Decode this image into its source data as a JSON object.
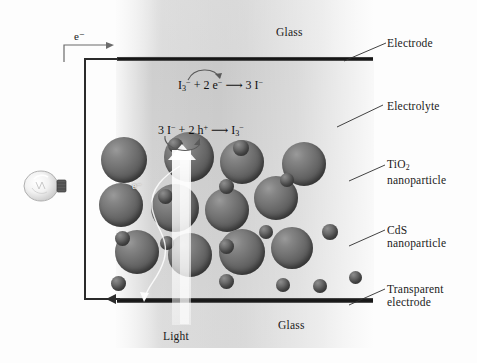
{
  "figure": {
    "glass_top_label": "Glass",
    "glass_bottom_label": "Glass",
    "light_label": "Light",
    "electron_label": "e⁻",
    "electron_inner_label": "e⁻"
  },
  "equations": {
    "top": {
      "reactant_species": "I",
      "reactant_sub": "3",
      "reactant_charge": "−",
      "plus": "+",
      "electrons": "2 e",
      "electrons_charge": "−",
      "arrow": "⟶",
      "product": "3 I",
      "product_charge": "−",
      "full_text": "I3⁻ + 2 e⁻ ⟶ 3 I⁻"
    },
    "bottom": {
      "reactant_species": "3 I",
      "reactant_charge": "−",
      "plus": "+",
      "holes": "2 h",
      "holes_charge": "+",
      "arrow": "⟶",
      "product": "I",
      "product_sub": "3",
      "product_charge": "−",
      "full_text": "3 I⁻ + 2 h⁺ ⟶ I3⁻"
    }
  },
  "callouts": [
    {
      "id": "electrode",
      "line1": "Electrode",
      "line2": ""
    },
    {
      "id": "electrolyte",
      "line1": "Electrolyte",
      "line2": ""
    },
    {
      "id": "tio2",
      "line1": "TiO",
      "sub": "2",
      "line2": "nanoparticle"
    },
    {
      "id": "cds",
      "line1": "CdS",
      "line2": "nanoparticle"
    },
    {
      "id": "transparent-elec",
      "line1": "Transparent",
      "line2": "electrode"
    }
  ],
  "colors": {
    "particle_fill": "#6a6a6a",
    "electrode": "#1b1b1b",
    "electrolyte": "#cccccc",
    "glass": "#e2e2e2",
    "wire": "#2b2b2b",
    "light_beam": "#ffffff",
    "text": "#1a1a1a"
  },
  "particles": {
    "tio2_note": "large gray spheres",
    "cds_note": "small gray spheres",
    "large": [
      {
        "x": 124,
        "y": 160,
        "d": 46
      },
      {
        "x": 189,
        "y": 157,
        "d": 50
      },
      {
        "x": 242,
        "y": 162,
        "d": 44
      },
      {
        "x": 304,
        "y": 164,
        "d": 44
      },
      {
        "x": 121,
        "y": 205,
        "d": 44
      },
      {
        "x": 175,
        "y": 208,
        "d": 48
      },
      {
        "x": 227,
        "y": 210,
        "d": 44
      },
      {
        "x": 276,
        "y": 198,
        "d": 44
      },
      {
        "x": 137,
        "y": 252,
        "d": 44
      },
      {
        "x": 190,
        "y": 255,
        "d": 44
      },
      {
        "x": 242,
        "y": 252,
        "d": 46
      },
      {
        "x": 292,
        "y": 248,
        "d": 42
      }
    ],
    "small": [
      {
        "x": 241,
        "y": 148,
        "d": 16
      },
      {
        "x": 175,
        "y": 145,
        "d": 15
      },
      {
        "x": 226,
        "y": 186,
        "d": 15
      },
      {
        "x": 287,
        "y": 180,
        "d": 14
      },
      {
        "x": 165,
        "y": 196,
        "d": 15
      },
      {
        "x": 266,
        "y": 232,
        "d": 14
      },
      {
        "x": 330,
        "y": 232,
        "d": 16
      },
      {
        "x": 122,
        "y": 238,
        "d": 15
      },
      {
        "x": 167,
        "y": 243,
        "d": 14
      },
      {
        "x": 226,
        "y": 246,
        "d": 15
      },
      {
        "x": 118,
        "y": 283,
        "d": 15
      },
      {
        "x": 226,
        "y": 281,
        "d": 15
      },
      {
        "x": 283,
        "y": 285,
        "d": 14
      },
      {
        "x": 320,
        "y": 286,
        "d": 14
      },
      {
        "x": 355,
        "y": 277,
        "d": 13
      }
    ]
  }
}
